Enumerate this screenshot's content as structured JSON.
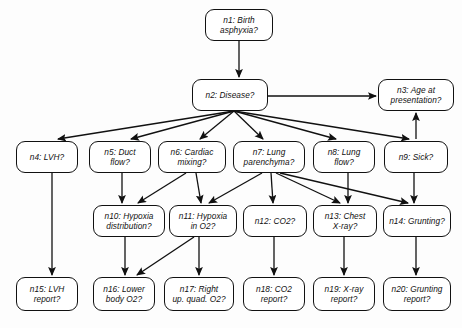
{
  "diagram": {
    "type": "directed-acyclic-graph",
    "background_color": "#fdfdfd",
    "node_fill": "#ffffff",
    "node_stroke": "#111111",
    "edge_color": "#111111",
    "width": 462,
    "height": 328
  },
  "nodes": [
    {
      "id": "n1",
      "label": "n1:  Birth\nasphyxia?",
      "x": 205,
      "y": 9,
      "w": 68,
      "h": 32,
      "align": "center"
    },
    {
      "id": "n2",
      "label": "n2:  Disease?",
      "x": 192,
      "y": 79,
      "w": 76,
      "h": 32,
      "align": "center"
    },
    {
      "id": "n3",
      "label": "n3:  Age at\npresentation?",
      "x": 378,
      "y": 79,
      "w": 76,
      "h": 32,
      "align": "center"
    },
    {
      "id": "n4",
      "label": "n4:  LVH?",
      "x": 16,
      "y": 141,
      "w": 62,
      "h": 32,
      "align": "center"
    },
    {
      "id": "n5",
      "label": "n5:  Duct\nflow?",
      "x": 89,
      "y": 141,
      "w": 62,
      "h": 32,
      "align": "center"
    },
    {
      "id": "n6",
      "label": "n6:  Cardiac\nmixing?",
      "x": 158,
      "y": 141,
      "w": 68,
      "h": 32,
      "align": "center"
    },
    {
      "id": "n7",
      "label": "n7:  Lung\nparenchyma?",
      "x": 233,
      "y": 141,
      "w": 72,
      "h": 32,
      "align": "center"
    },
    {
      "id": "n8",
      "label": "n8:  Lung\nflow?",
      "x": 313,
      "y": 141,
      "w": 62,
      "h": 32,
      "align": "center"
    },
    {
      "id": "n9",
      "label": "n9:  Sick?",
      "x": 384,
      "y": 141,
      "w": 64,
      "h": 32,
      "align": "center"
    },
    {
      "id": "n10",
      "label": "n10:  Hypoxia\ndistribution?",
      "x": 93,
      "y": 205,
      "w": 72,
      "h": 32,
      "align": "center"
    },
    {
      "id": "n11",
      "label": "n11:  Hypoxia\nin O2?",
      "x": 169,
      "y": 205,
      "w": 68,
      "h": 32,
      "align": "center"
    },
    {
      "id": "n12",
      "label": "n12:  CO2?",
      "x": 243,
      "y": 205,
      "w": 64,
      "h": 32,
      "align": "center"
    },
    {
      "id": "n13",
      "label": "n13:  Chest\nX-ray?",
      "x": 313,
      "y": 205,
      "w": 64,
      "h": 32,
      "align": "center"
    },
    {
      "id": "n14",
      "label": "n14: Grunting?",
      "x": 383,
      "y": 205,
      "w": 68,
      "h": 32,
      "align": "center"
    },
    {
      "id": "n15",
      "label": "n15: LVH\nreport?",
      "x": 16,
      "y": 277,
      "w": 62,
      "h": 34,
      "align": "center"
    },
    {
      "id": "n16",
      "label": "n16:  Lower\nbody O2?",
      "x": 93,
      "y": 277,
      "w": 62,
      "h": 34,
      "align": "center"
    },
    {
      "id": "n17",
      "label": "n17:  Right\nup. quad. O2?",
      "x": 164,
      "y": 277,
      "w": 70,
      "h": 34,
      "align": "center"
    },
    {
      "id": "n18",
      "label": "n18:  CO2\nreport?",
      "x": 243,
      "y": 277,
      "w": 62,
      "h": 34,
      "align": "center"
    },
    {
      "id": "n19",
      "label": "n19:  X-ray\nreport?",
      "x": 313,
      "y": 277,
      "w": 62,
      "h": 34,
      "align": "center"
    },
    {
      "id": "n20",
      "label": "n20:  Grunting\nreport?",
      "x": 383,
      "y": 277,
      "w": 68,
      "h": 34,
      "align": "center"
    }
  ],
  "edges": [
    {
      "from": "n1",
      "to": "n2"
    },
    {
      "from": "n2",
      "to": "n3"
    },
    {
      "from": "n2",
      "to": "n4"
    },
    {
      "from": "n2",
      "to": "n5"
    },
    {
      "from": "n2",
      "to": "n6"
    },
    {
      "from": "n2",
      "to": "n7"
    },
    {
      "from": "n2",
      "to": "n8"
    },
    {
      "from": "n2",
      "to": "n9"
    },
    {
      "from": "n9",
      "to": "n3"
    },
    {
      "from": "n5",
      "to": "n10"
    },
    {
      "from": "n6",
      "to": "n10"
    },
    {
      "from": "n6",
      "to": "n11"
    },
    {
      "from": "n7",
      "to": "n11"
    },
    {
      "from": "n7",
      "to": "n12"
    },
    {
      "from": "n7",
      "to": "n13"
    },
    {
      "from": "n7",
      "to": "n14"
    },
    {
      "from": "n8",
      "to": "n13"
    },
    {
      "from": "n9",
      "to": "n14"
    },
    {
      "from": "n4",
      "to": "n15"
    },
    {
      "from": "n10",
      "to": "n16"
    },
    {
      "from": "n11",
      "to": "n16"
    },
    {
      "from": "n11",
      "to": "n17"
    },
    {
      "from": "n12",
      "to": "n18"
    },
    {
      "from": "n13",
      "to": "n19"
    },
    {
      "from": "n14",
      "to": "n20"
    }
  ],
  "edge_paths": [
    {
      "from": "n1",
      "to": "n2",
      "x1": 239,
      "y1": 41,
      "x2": 239,
      "y2": 77
    },
    {
      "from": "n2",
      "to": "n3",
      "x1": 268,
      "y1": 96,
      "x2": 376,
      "y2": 96
    },
    {
      "from": "n2",
      "to": "n4",
      "x1": 234,
      "y1": 111,
      "x2": 58,
      "y2": 139
    },
    {
      "from": "n2",
      "to": "n5",
      "x1": 234,
      "y1": 111,
      "x2": 131,
      "y2": 139
    },
    {
      "from": "n2",
      "to": "n6",
      "x1": 234,
      "y1": 111,
      "x2": 200,
      "y2": 139
    },
    {
      "from": "n2",
      "to": "n7",
      "x1": 234,
      "y1": 111,
      "x2": 263,
      "y2": 139
    },
    {
      "from": "n2",
      "to": "n8",
      "x1": 234,
      "y1": 111,
      "x2": 336,
      "y2": 139
    },
    {
      "from": "n2",
      "to": "n9",
      "x1": 234,
      "y1": 111,
      "x2": 409,
      "y2": 139
    },
    {
      "from": "n9",
      "to": "n3",
      "x1": 416,
      "y1": 139,
      "x2": 416,
      "y2": 113
    },
    {
      "from": "n5",
      "to": "n10",
      "x1": 122,
      "y1": 173,
      "x2": 122,
      "y2": 203
    },
    {
      "from": "n6",
      "to": "n10",
      "x1": 186,
      "y1": 173,
      "x2": 138,
      "y2": 203
    },
    {
      "from": "n6",
      "to": "n11",
      "x1": 196,
      "y1": 173,
      "x2": 201,
      "y2": 203
    },
    {
      "from": "n7",
      "to": "n11",
      "x1": 262,
      "y1": 173,
      "x2": 209,
      "y2": 203
    },
    {
      "from": "n7",
      "to": "n12",
      "x1": 271,
      "y1": 173,
      "x2": 273,
      "y2": 203
    },
    {
      "from": "n7",
      "to": "n13",
      "x1": 276,
      "y1": 173,
      "x2": 340,
      "y2": 203
    },
    {
      "from": "n7",
      "to": "n14",
      "x1": 280,
      "y1": 173,
      "x2": 408,
      "y2": 203
    },
    {
      "from": "n8",
      "to": "n13",
      "x1": 348,
      "y1": 173,
      "x2": 348,
      "y2": 203
    },
    {
      "from": "n9",
      "to": "n14",
      "x1": 414,
      "y1": 173,
      "x2": 414,
      "y2": 203
    },
    {
      "from": "n4",
      "to": "n15",
      "x1": 52,
      "y1": 173,
      "x2": 52,
      "y2": 275
    },
    {
      "from": "n10",
      "to": "n16",
      "x1": 125,
      "y1": 237,
      "x2": 125,
      "y2": 275
    },
    {
      "from": "n11",
      "to": "n16",
      "x1": 194,
      "y1": 237,
      "x2": 137,
      "y2": 275
    },
    {
      "from": "n11",
      "to": "n17",
      "x1": 199,
      "y1": 237,
      "x2": 199,
      "y2": 275
    },
    {
      "from": "n12",
      "to": "n18",
      "x1": 274,
      "y1": 237,
      "x2": 274,
      "y2": 275
    },
    {
      "from": "n13",
      "to": "n19",
      "x1": 344,
      "y1": 237,
      "x2": 344,
      "y2": 275
    },
    {
      "from": "n14",
      "to": "n20",
      "x1": 416,
      "y1": 237,
      "x2": 416,
      "y2": 275
    }
  ]
}
